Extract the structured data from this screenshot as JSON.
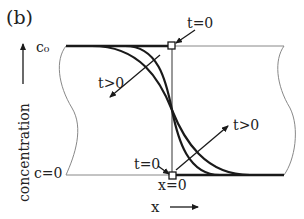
{
  "figure": {
    "panel_label": "(b)",
    "y_axis_label": "concentration",
    "x_axis_label": "x",
    "top_level_label": "c₀",
    "bottom_level_label": "c=0",
    "origin_label": "x=0",
    "annotations": {
      "t0_top": "t=0",
      "t0_bottom": "t=0",
      "tpos_left": "t>0",
      "tpos_right": "t>0"
    }
  },
  "colors": {
    "curve": "#1a1a1a",
    "outline": "#777777",
    "text": "#222222"
  }
}
